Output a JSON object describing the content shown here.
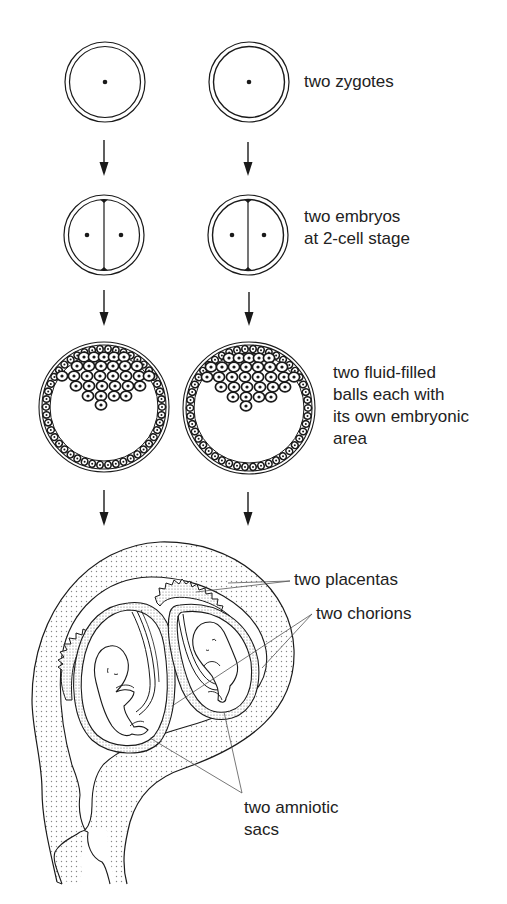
{
  "diagram": {
    "stages": [
      {
        "id": "zygotes",
        "label": "two zygotes"
      },
      {
        "id": "two-cell",
        "label_line1": "two embryos",
        "label_line2": "at 2-cell stage"
      },
      {
        "id": "blastocysts",
        "label_line1": "two fluid-filled",
        "label_line2": "balls each with",
        "label_line3": "its own embryonic",
        "label_line4": "area"
      },
      {
        "id": "uterus",
        "callouts": {
          "placentas": "two placentas",
          "chorions": "two chorions",
          "amniotic_line1": "two amniotic",
          "amniotic_line2": "sacs"
        }
      }
    ],
    "colors": {
      "ink": "#1a1a1a",
      "stipple": "#bdbdbd",
      "leader": "#555555",
      "background": "#ffffff"
    }
  }
}
